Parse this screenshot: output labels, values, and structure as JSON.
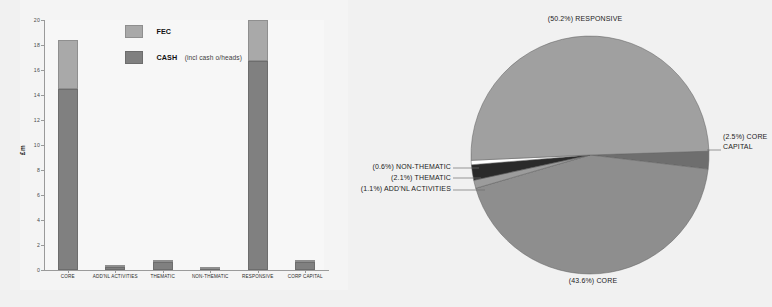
{
  "bar_chart": {
    "ylabel": "£m",
    "legend": [
      {
        "key": "fec",
        "label": "FEC",
        "sub": "",
        "color": "#a9a9a9"
      },
      {
        "key": "cash",
        "label": "CASH",
        "sub": "(incl cash o/heads)",
        "color": "#808080"
      }
    ],
    "yticks": [
      "0",
      "2",
      "4",
      "6",
      "8",
      "10",
      "12",
      "14",
      "16",
      "18",
      "20"
    ]
  },
  "chart_data": [
    {
      "type": "bar",
      "stacked": true,
      "title": "",
      "xlabel": "",
      "ylabel": "£m",
      "ylim": [
        0,
        20
      ],
      "ytick_step": 2,
      "grid": false,
      "legend_position": "inside-top-left",
      "categories": [
        "CORE",
        "ADD'NL ACTIVITIES",
        "THEMATIC",
        "NON-THEMATIC",
        "RESPONSIVE",
        "CORP CAPITAL"
      ],
      "series": [
        {
          "name": "CASH (incl cash o/heads)",
          "color": "#808080",
          "values": [
            14.5,
            0.25,
            0.62,
            0.12,
            16.7,
            0.63
          ]
        },
        {
          "name": "FEC",
          "color": "#a9a9a9",
          "values": [
            3.9,
            0.05,
            0.08,
            0.02,
            3.3,
            0.05
          ]
        }
      ],
      "totals": [
        18.4,
        0.3,
        0.7,
        0.14,
        20.0,
        0.68
      ]
    },
    {
      "type": "pie",
      "title": "",
      "legend_position": "callout-labels",
      "labels": [
        "RESPONSIVE",
        "CORE",
        "CORE CAPITAL",
        "ADD'NL ACTIVITIES",
        "THEMATIC",
        "NON-THEMATIC"
      ],
      "values": [
        50.2,
        43.6,
        2.5,
        1.1,
        2.1,
        0.6
      ],
      "value_suffix": "%",
      "colors": [
        "#a0a0a0",
        "#8e8e8e",
        "#6e6e6e",
        "#9c9c9c",
        "#2a2a2a",
        "#ffffff"
      ],
      "callouts": [
        {
          "text": "(50.2%) RESPONSIVE",
          "position": "top"
        },
        {
          "text": "(43.6%) CORE",
          "position": "bottom"
        },
        {
          "text": "(2.5%) CORE",
          "text2": "CAPITAL",
          "position": "right"
        },
        {
          "text": "(0.6%) NON-THEMATIC",
          "position": "left"
        },
        {
          "text": "(2.1%) THEMATIC",
          "position": "left"
        },
        {
          "text": "(1.1%) ADD'NL ACTIVITIES",
          "position": "left"
        }
      ]
    }
  ],
  "pie_labels": {
    "top": "(50.2%) RESPONSIVE",
    "bottom": "(43.6%) CORE",
    "right_line1": "(2.5%) CORE",
    "right_line2": "CAPITAL",
    "left_line1": "(0.6%) NON-THEMATIC",
    "left_line2": "(2.1%) THEMATIC",
    "left_line3": "(1.1%) ADD'NL ACTIVITIES"
  }
}
